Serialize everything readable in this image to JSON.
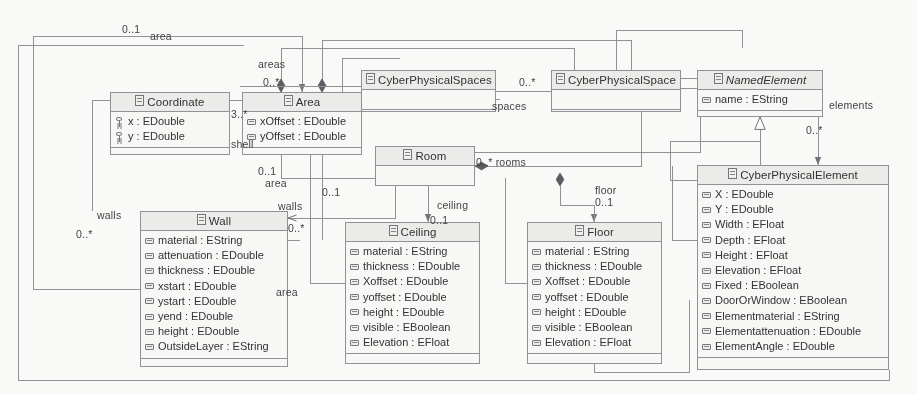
{
  "diagram": {
    "kind": "uml-class-diagram",
    "line_color": "#8d9096",
    "header_fill": "#eeeeec",
    "body_fill": "#fbfbfa",
    "text_color": "#2b2b2b"
  },
  "classes": [
    {
      "id": "coordinate",
      "name": "Coordinate",
      "abstract": false,
      "x": 110,
      "y": 92,
      "w": 120,
      "h": 63,
      "attributes": [
        {
          "icon": "key-icon",
          "text": "x : EDouble"
        },
        {
          "icon": "key-icon",
          "text": "y : EDouble"
        }
      ]
    },
    {
      "id": "area",
      "name": "Area",
      "abstract": false,
      "x": 242,
      "y": 92,
      "w": 120,
      "h": 63,
      "attributes": [
        {
          "icon": "attribute-icon",
          "text": "xOffset : EDouble"
        },
        {
          "icon": "attribute-icon",
          "text": "yOffset : EDouble"
        }
      ]
    },
    {
      "id": "cyberphysicalspaces",
      "name": "CyberPhysicalSpaces",
      "abstract": false,
      "x": 361,
      "y": 70,
      "w": 135,
      "h": 42,
      "attributes": []
    },
    {
      "id": "cyberphysicalspace",
      "name": "CyberPhysicalSpace",
      "abstract": false,
      "x": 551,
      "y": 70,
      "w": 130,
      "h": 42,
      "attributes": []
    },
    {
      "id": "namedelement",
      "name": "NamedElement",
      "abstract": true,
      "x": 697,
      "y": 70,
      "w": 126,
      "h": 47,
      "attributes": [
        {
          "icon": "attribute-icon",
          "text": "name : EString"
        }
      ]
    },
    {
      "id": "room",
      "name": "Room",
      "abstract": false,
      "x": 375,
      "y": 146,
      "w": 100,
      "h": 40,
      "attributes": []
    },
    {
      "id": "wall",
      "name": "Wall",
      "abstract": false,
      "x": 140,
      "y": 211,
      "w": 148,
      "h": 156,
      "attributes": [
        {
          "icon": "attribute-icon",
          "text": "material : EString"
        },
        {
          "icon": "attribute-icon",
          "text": "attenuation : EDouble"
        },
        {
          "icon": "attribute-icon",
          "text": "thickness : EDouble"
        },
        {
          "icon": "attribute-icon",
          "text": "xstart : EDouble"
        },
        {
          "icon": "attribute-icon",
          "text": "ystart : EDouble"
        },
        {
          "icon": "attribute-icon",
          "text": "yend : EDouble"
        },
        {
          "icon": "attribute-icon",
          "text": "height : EDouble"
        },
        {
          "icon": "attribute-icon",
          "text": "OutsideLayer : EString"
        }
      ]
    },
    {
      "id": "ceiling",
      "name": "Ceiling",
      "abstract": false,
      "x": 345,
      "y": 222,
      "w": 135,
      "h": 142,
      "attributes": [
        {
          "icon": "attribute-icon",
          "text": "material : EString"
        },
        {
          "icon": "attribute-icon",
          "text": "thickness : EDouble"
        },
        {
          "icon": "attribute-icon",
          "text": "Xoffset : EDouble"
        },
        {
          "icon": "attribute-icon",
          "text": "yoffset : EDouble"
        },
        {
          "icon": "attribute-icon",
          "text": "height : EDouble"
        },
        {
          "icon": "attribute-icon",
          "text": "visible : EBoolean"
        },
        {
          "icon": "attribute-icon",
          "text": "Elevation : EFloat"
        }
      ]
    },
    {
      "id": "floor",
      "name": "Floor",
      "abstract": false,
      "x": 527,
      "y": 222,
      "w": 135,
      "h": 142,
      "attributes": [
        {
          "icon": "attribute-icon",
          "text": "material : EString"
        },
        {
          "icon": "attribute-icon",
          "text": "thickness : EDouble"
        },
        {
          "icon": "attribute-icon",
          "text": "Xoffset : EDouble"
        },
        {
          "icon": "attribute-icon",
          "text": "yoffset : EDouble"
        },
        {
          "icon": "attribute-icon",
          "text": "height : EDouble"
        },
        {
          "icon": "attribute-icon",
          "text": "visible : EBoolean"
        },
        {
          "icon": "attribute-icon",
          "text": "Elevation : EFloat"
        }
      ]
    },
    {
      "id": "cyberphysicalelement",
      "name": "CyberPhysicalElement",
      "abstract": false,
      "x": 697,
      "y": 165,
      "w": 192,
      "h": 205,
      "attributes": [
        {
          "icon": "attribute-icon",
          "text": "X : EDouble"
        },
        {
          "icon": "attribute-icon",
          "text": "Y : EDouble"
        },
        {
          "icon": "attribute-icon",
          "text": "Width : EFloat"
        },
        {
          "icon": "attribute-icon",
          "text": "Depth : EFloat"
        },
        {
          "icon": "attribute-icon",
          "text": "Height : EFloat"
        },
        {
          "icon": "attribute-icon",
          "text": "Elevation : EFloat"
        },
        {
          "icon": "attribute-icon",
          "text": "Fixed : EBoolean"
        },
        {
          "icon": "attribute-icon",
          "text": "DoorOrWindow : EBoolean"
        },
        {
          "icon": "attribute-icon",
          "text": "Elementmaterial : EString"
        },
        {
          "icon": "attribute-icon",
          "text": "Elementattenuation : EDouble"
        },
        {
          "icon": "attribute-icon",
          "text": "ElementAngle : EDouble"
        }
      ]
    }
  ],
  "edge_labels": [
    {
      "id": "l1",
      "text": "0..1",
      "x": 122,
      "y": 23
    },
    {
      "id": "l2",
      "text": "area",
      "x": 150,
      "y": 30
    },
    {
      "id": "l3",
      "text": "areas",
      "x": 258,
      "y": 58
    },
    {
      "id": "l4",
      "text": "0..*",
      "x": 263,
      "y": 76
    },
    {
      "id": "l5",
      "text": "3..*",
      "x": 231,
      "y": 108
    },
    {
      "id": "l6",
      "text": "shell",
      "x": 231,
      "y": 138
    },
    {
      "id": "l7",
      "text": "0..*",
      "x": 519,
      "y": 76
    },
    {
      "id": "l8",
      "text": "spaces",
      "x": 492,
      "y": 100
    },
    {
      "id": "l9",
      "text": "elements",
      "x": 829,
      "y": 99
    },
    {
      "id": "l10",
      "text": "0..*",
      "x": 806,
      "y": 124
    },
    {
      "id": "l11",
      "text": "0..1",
      "x": 258,
      "y": 165
    },
    {
      "id": "l12",
      "text": "area",
      "x": 265,
      "y": 177
    },
    {
      "id": "l13",
      "text": "0..1",
      "x": 322,
      "y": 186
    },
    {
      "id": "l14",
      "text": "0..* rooms",
      "x": 476,
      "y": 156
    },
    {
      "id": "l15",
      "text": "floor",
      "x": 595,
      "y": 184
    },
    {
      "id": "l16",
      "text": "0..1",
      "x": 595,
      "y": 196
    },
    {
      "id": "l17",
      "text": "walls",
      "x": 278,
      "y": 200
    },
    {
      "id": "l18",
      "text": "0..*",
      "x": 288,
      "y": 222
    },
    {
      "id": "l19",
      "text": "walls",
      "x": 97,
      "y": 209
    },
    {
      "id": "l20",
      "text": "0..*",
      "x": 76,
      "y": 228
    },
    {
      "id": "l21",
      "text": "ceiling",
      "x": 437,
      "y": 199
    },
    {
      "id": "l22",
      "text": "0..1",
      "x": 430,
      "y": 214
    },
    {
      "id": "l23",
      "text": "area",
      "x": 276,
      "y": 286
    }
  ],
  "relationships": [
    {
      "from": "CyberPhysicalSpace",
      "to": "Area",
      "role": "areas",
      "multiplicity": "0..*",
      "type": "composition"
    },
    {
      "from": "CyberPhysicalSpaces",
      "to": "CyberPhysicalSpace",
      "role": "spaces",
      "multiplicity": "0..*",
      "type": "composition"
    },
    {
      "from": "Area",
      "to": "Coordinate",
      "role": "shell",
      "multiplicity": "3..*",
      "type": "composition"
    },
    {
      "from": "CyberPhysicalSpace",
      "to": "Room",
      "role": "rooms",
      "multiplicity": "0..*",
      "type": "composition"
    },
    {
      "from": "Room",
      "to": "Wall",
      "role": "walls",
      "multiplicity": "0..*",
      "type": "composition"
    },
    {
      "from": "Room",
      "to": "Ceiling",
      "role": "ceiling",
      "multiplicity": "0..1",
      "type": "composition"
    },
    {
      "from": "Room",
      "to": "Floor",
      "role": "floor",
      "multiplicity": "0..1",
      "type": "composition"
    },
    {
      "from": "Wall",
      "to": "Area",
      "role": "area",
      "multiplicity": "0..1",
      "type": "association"
    },
    {
      "from": "Ceiling",
      "to": "Area",
      "role": "area",
      "multiplicity": "0..1",
      "type": "association"
    },
    {
      "from": "Floor",
      "to": "Area",
      "role": "area",
      "multiplicity": "0..1",
      "type": "association"
    },
    {
      "from": "CyberPhysicalSpace",
      "to": "CyberPhysicalElement",
      "role": "elements",
      "multiplicity": "0..*",
      "type": "composition"
    },
    {
      "from": "CyberPhysicalSpace",
      "to": "NamedElement",
      "type": "generalization"
    },
    {
      "from": "CyberPhysicalElement",
      "to": "NamedElement",
      "type": "generalization"
    }
  ]
}
